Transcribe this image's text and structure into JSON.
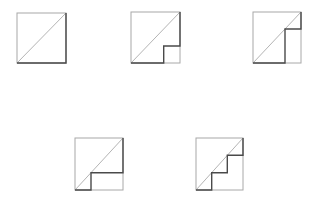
{
  "colors": {
    "background": "#ffffff",
    "square_outline": "#a8a8a8",
    "diagonal": "#b4b4b4",
    "staircase_path": "#4a4a4a"
  },
  "figures": [
    {
      "id": "fig-1",
      "description": "single step: along bottom edge then up right edge",
      "steps": [
        [
          1,
          1
        ]
      ]
    },
    {
      "id": "fig-2",
      "description": "corner cut: small notch at bottom-right",
      "steps": [
        [
          0.667,
          0.333
        ],
        [
          1,
          1
        ]
      ]
    },
    {
      "id": "fig-3",
      "description": "tall notch on right side",
      "steps": [
        [
          0.667,
          0.667
        ],
        [
          1,
          1
        ]
      ]
    },
    {
      "id": "fig-4",
      "description": "low step near bottom-left",
      "steps": [
        [
          0.333,
          0.333
        ],
        [
          1,
          1
        ]
      ]
    },
    {
      "id": "fig-5",
      "description": "three-step staircase",
      "steps": [
        [
          0.333,
          0.333
        ],
        [
          0.667,
          0.667
        ],
        [
          1,
          1
        ]
      ]
    }
  ]
}
